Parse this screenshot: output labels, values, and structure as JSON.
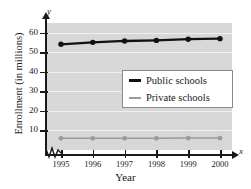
{
  "chart_data": {
    "type": "line",
    "title": "",
    "xlabel": "Year",
    "ylabel": "Enrollment (in millions)",
    "x": [
      1995,
      1996,
      1997,
      1998,
      1999,
      2000
    ],
    "xticklabels": [
      "1995",
      "1996",
      "1997",
      "1998",
      "1999",
      "2000"
    ],
    "yticks": [
      10,
      20,
      30,
      40,
      50,
      60
    ],
    "yticklabels": [
      "10",
      "20",
      "30",
      "40",
      "50",
      "60"
    ],
    "ylim": [
      0,
      65
    ],
    "grid": "horizontal",
    "legend_position": "upper-right-inside",
    "axis_break": "x-axis-break-near-origin",
    "axis_variables": {
      "x": "x",
      "y": "y"
    },
    "series": [
      {
        "name": "Public schools",
        "color": "#111111",
        "marker": "filled-circle",
        "linewidth": "thick",
        "values": [
          54.1,
          55.1,
          55.8,
          56.1,
          56.7,
          57.0
        ]
      },
      {
        "name": "Private schools",
        "color": "#9a9a9a",
        "marker": "filled-circle",
        "linewidth": "thin",
        "values": [
          6.0,
          6.0,
          6.0,
          6.0,
          6.1,
          6.1
        ]
      }
    ]
  },
  "legend": {
    "entries": [
      {
        "label": "Public schools"
      },
      {
        "label": "Private schools"
      }
    ]
  },
  "colors": {
    "plot_background": "#d7d7d7",
    "gridline": "#f0f0f0",
    "axis": "#1a1a1a",
    "public": "#111111",
    "private": "#9a9a9a",
    "legend_background": "#ffffff",
    "legend_border": "#8a8a8a"
  }
}
